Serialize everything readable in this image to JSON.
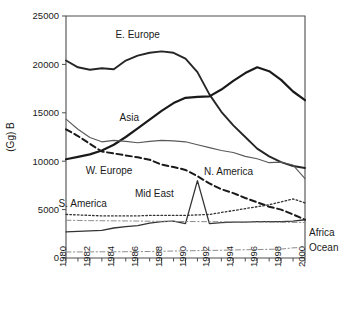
{
  "chart_data": {
    "type": "line",
    "title": "",
    "xlabel": "",
    "ylabel": "(Gg) B",
    "xlim": [
      1980,
      2000
    ],
    "ylim": [
      0,
      25000
    ],
    "grid": false,
    "legend_position": "inline-annotations",
    "x": [
      1980,
      1981,
      1982,
      1983,
      1984,
      1985,
      1986,
      1987,
      1988,
      1989,
      1990,
      1991,
      1992,
      1993,
      1994,
      1995,
      1996,
      1997,
      1998,
      1999,
      2000
    ],
    "xticks": [
      1980,
      1982,
      1984,
      1986,
      1988,
      1990,
      1992,
      1994,
      1996,
      1998,
      2000
    ],
    "xtick_labels": [
      "1980",
      "1982",
      "1984",
      "1986",
      "1988",
      "1990",
      "1992",
      "1994",
      "1996",
      "1998",
      "2000"
    ],
    "yticks": [
      0,
      5000,
      10000,
      15000,
      20000,
      25000
    ],
    "ytick_labels": [
      "0",
      "5000",
      "10000",
      "15000",
      "20000",
      "25000"
    ],
    "series": [
      {
        "name": "E. Europe",
        "style": "solid",
        "width": 1.9,
        "color": "#262626",
        "label_x": 1986.0,
        "label_y": 22700,
        "values": [
          20400,
          19700,
          19450,
          19600,
          19500,
          20400,
          20900,
          21200,
          21350,
          21200,
          20600,
          19200,
          16900,
          15100,
          13700,
          12500,
          11300,
          10500,
          9900,
          9500,
          9300
        ]
      },
      {
        "name": "Asia",
        "style": "solid",
        "width": 2.2,
        "color": "#1a1a1a",
        "label_x": 1985.3,
        "label_y": 14200,
        "values": [
          10200,
          10450,
          10700,
          11100,
          11700,
          12500,
          13400,
          14300,
          15200,
          16000,
          16550,
          16650,
          16700,
          17400,
          18300,
          19100,
          19700,
          19300,
          18400,
          17200,
          16300
        ]
      },
      {
        "name": "N. America",
        "style": "solid",
        "width": 1.1,
        "color": "#595959",
        "label_x": 1993.6,
        "label_y": 8600,
        "values": [
          14350,
          13300,
          12450,
          12000,
          12150,
          12050,
          11900,
          12050,
          12150,
          12100,
          12000,
          11700,
          11400,
          11100,
          10900,
          10500,
          10250,
          9850,
          9900,
          9600,
          8200
        ]
      },
      {
        "name": "W. Europe",
        "style": "dashed",
        "width": 2.0,
        "color": "#1a1a1a",
        "label_x": 1983.6,
        "label_y": 8700,
        "values": [
          13300,
          12600,
          11800,
          11000,
          10800,
          10600,
          10400,
          10150,
          9650,
          9400,
          9100,
          8450,
          7700,
          7100,
          6700,
          6200,
          5750,
          5300,
          5000,
          4500,
          3950
        ]
      },
      {
        "name": "S. America",
        "style": "dotted",
        "width": 1.3,
        "color": "#333333",
        "label_x": 1981.4,
        "label_y": 5300,
        "values": [
          4500,
          4450,
          4400,
          4350,
          4350,
          4350,
          4350,
          4400,
          4400,
          4400,
          4400,
          4450,
          4500,
          4700,
          4900,
          5100,
          5300,
          5500,
          5800,
          6100,
          5700
        ]
      },
      {
        "name": "Mid East",
        "style": "solid",
        "width": 1.3,
        "color": "#333333",
        "label_x": 1987.4,
        "label_y": 6300,
        "values": [
          2700,
          2750,
          2800,
          2850,
          3100,
          3250,
          3350,
          3600,
          3750,
          3800,
          3550,
          8000,
          3550,
          3650,
          3700,
          3700,
          3750,
          3750,
          3750,
          3800,
          3950
        ],
        "annotation": "Spike at 1991 (~8000)"
      },
      {
        "name": "Africa",
        "style": "dashdot",
        "width": 1.0,
        "color": "#8c8c8c",
        "label_x": 2001.0,
        "label_y": 2650,
        "values": [
          3900,
          3880,
          3860,
          3850,
          3840,
          3830,
          3820,
          3800,
          3790,
          3780,
          3770,
          3760,
          3750,
          3740,
          3730,
          3720,
          3710,
          3700,
          3690,
          3680,
          3670
        ]
      },
      {
        "name": "Ocean",
        "style": "dashdot",
        "width": 1.0,
        "color": "#8c8c8c",
        "label_x": 2001.0,
        "label_y": 1050,
        "values": [
          620,
          625,
          630,
          640,
          640,
          650,
          660,
          670,
          700,
          720,
          740,
          760,
          780,
          800,
          830,
          850,
          870,
          900,
          920,
          1050,
          1100
        ]
      }
    ]
  }
}
